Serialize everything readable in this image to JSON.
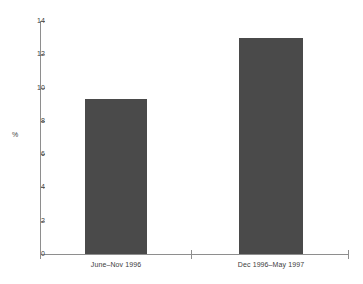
{
  "chart_data": {
    "type": "bar",
    "title": "",
    "xlabel": "",
    "ylabel": "%",
    "categories": [
      "June–Nov 1996",
      "Dec 1996–May 1997"
    ],
    "values": [
      9.3,
      13.0
    ],
    "ylim": [
      0,
      14
    ],
    "yticks": [
      0,
      2,
      4,
      6,
      8,
      10,
      12,
      14
    ],
    "ytick_labels": [
      "0",
      "2",
      "4",
      "6",
      "8",
      "10",
      "12",
      "14"
    ],
    "grid": false,
    "legend": null,
    "bar_color": "#4a4a4a",
    "axis_color": "#8e8e8e",
    "text_color": "#3d3d3d",
    "background": "#ffffff"
  }
}
